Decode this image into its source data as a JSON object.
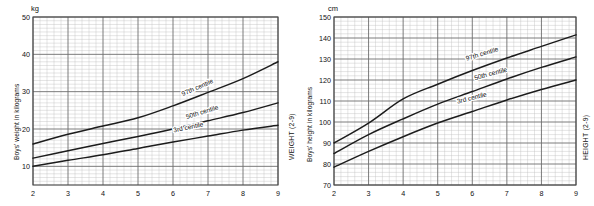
{
  "charts": [
    {
      "id": "boys-weight-2-9",
      "unit": "kg",
      "y_axis_title": "Boys' weight in kilograms",
      "side_title": "WEIGHT (2-9)",
      "x_ticks": [
        "2",
        "3",
        "4",
        "5",
        "6",
        "7",
        "8",
        "9"
      ],
      "y_ticks": [
        "50",
        "40",
        "30",
        "20",
        "10"
      ],
      "curve_labels": [
        "97th centile",
        "50th centile",
        "3rd centile"
      ]
    },
    {
      "id": "boys-height-2-9",
      "unit": "cm",
      "y_axis_title": "Boys' height in kilograms",
      "side_title": "HEIGHT (2-9)",
      "x_ticks": [
        "2",
        "3",
        "4",
        "5",
        "6",
        "7",
        "8",
        "9"
      ],
      "y_ticks": [
        "150",
        "140",
        "130",
        "120",
        "110",
        "100",
        "90",
        "80",
        "70"
      ],
      "curve_labels": [
        "97th centile",
        "50th centile",
        "3rd centile"
      ]
    }
  ],
  "colors": {
    "curve": "#1c1c1c",
    "major_grid": "#6d6d6d",
    "minor_grid": "#bdbdbd",
    "frame": "#4a4a4a",
    "text": "#111111",
    "background": "#ffffff"
  },
  "chart_data": [
    {
      "type": "line",
      "title": "Boys' weight (2-9 years)",
      "xlabel": "Age (years)",
      "ylabel": "Boys' weight in kilograms",
      "unit": "kg",
      "xlim": [
        2,
        9
      ],
      "ylim": [
        5,
        50
      ],
      "y_tick_labels": [
        50,
        40,
        30,
        20,
        10
      ],
      "x_tick_labels": [
        2,
        3,
        4,
        5,
        6,
        7,
        8,
        9
      ],
      "grid": true,
      "legend": "inline-annotations",
      "x": [
        2,
        3,
        4,
        5,
        6,
        7,
        8,
        9
      ],
      "series": [
        {
          "name": "97th centile",
          "values": [
            16.0,
            18.6,
            20.8,
            23.0,
            26.2,
            29.8,
            33.5,
            38.0
          ]
        },
        {
          "name": "50th centile",
          "values": [
            12.2,
            14.2,
            16.1,
            18.0,
            20.0,
            22.2,
            24.4,
            27.0
          ]
        },
        {
          "name": "3rd centile",
          "values": [
            10.0,
            11.6,
            13.1,
            14.8,
            16.5,
            18.1,
            19.7,
            21.0
          ]
        }
      ]
    },
    {
      "type": "line",
      "title": "Boys' height (2-9 years)",
      "xlabel": "Age (years)",
      "ylabel": "Boys' height in kilograms",
      "unit": "cm",
      "xlim": [
        2,
        9
      ],
      "ylim": [
        70,
        150
      ],
      "y_tick_labels": [
        150,
        140,
        130,
        120,
        110,
        100,
        90,
        80,
        70
      ],
      "x_tick_labels": [
        2,
        3,
        4,
        5,
        6,
        7,
        8,
        9
      ],
      "grid": true,
      "legend": "inline-annotations",
      "x": [
        2,
        3,
        4,
        5,
        6,
        7,
        8,
        9
      ],
      "series": [
        {
          "name": "97th centile",
          "values": [
            90.0,
            99.5,
            111.0,
            118.0,
            124.5,
            130.5,
            136.0,
            141.5
          ]
        },
        {
          "name": "50th centile",
          "values": [
            85.0,
            94.0,
            101.5,
            108.5,
            114.5,
            120.5,
            126.0,
            131.0
          ]
        },
        {
          "name": "3rd centile",
          "values": [
            78.5,
            86.0,
            93.0,
            99.5,
            105.0,
            110.5,
            115.5,
            120.0
          ]
        }
      ]
    }
  ]
}
